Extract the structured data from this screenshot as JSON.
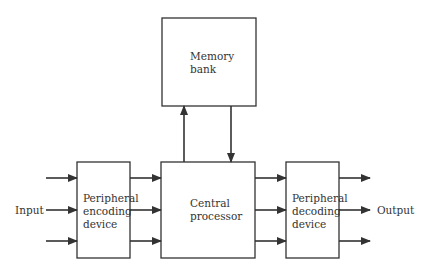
{
  "diagram": {
    "type": "block-diagram",
    "blocks": {
      "memory": {
        "label": "Memory\nbank"
      },
      "encoder": {
        "label": "Peripheral\nencoding\ndevice"
      },
      "processor": {
        "label": "Central\nprocessor"
      },
      "decoder": {
        "label": "Peripheral\ndecoding\ndevice"
      }
    },
    "terminals": {
      "input": "Input",
      "output": "Output"
    },
    "connections": [
      {
        "from": "Input",
        "to": "Peripheral encoding device",
        "count": 3
      },
      {
        "from": "Peripheral encoding device",
        "to": "Central processor",
        "count": 3
      },
      {
        "from": "Central processor",
        "to": "Memory bank",
        "count": 1
      },
      {
        "from": "Memory bank",
        "to": "Central processor",
        "count": 1
      },
      {
        "from": "Central processor",
        "to": "Peripheral decoding device",
        "count": 3
      },
      {
        "from": "Peripheral decoding device",
        "to": "Output",
        "count": 3
      }
    ],
    "colors": {
      "stroke": "#333333",
      "background": "#ffffff"
    }
  }
}
